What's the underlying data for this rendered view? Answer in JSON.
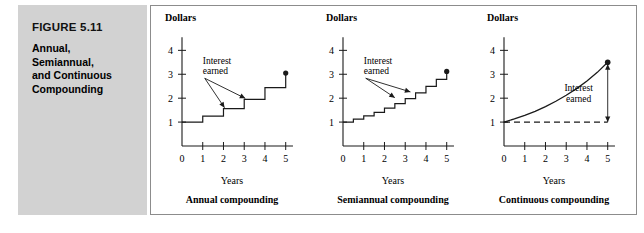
{
  "figure": {
    "number_label": "FIGURE 5.11",
    "title_lines": "Annual,\nSemiannual,\nand Continuous\nCompounding",
    "title_line_1": "Annual,",
    "title_line_2": "Semiannual,",
    "title_line_3": "and Continuous",
    "title_line_4": "Compounding",
    "panel_background": "#d2d2d2"
  },
  "common": {
    "y_axis_title": "Dollars",
    "x_axis_title": "Years",
    "annotation_interest": "Interest",
    "annotation_earned": "earned",
    "y_ticks": [
      "1",
      "2",
      "3",
      "4"
    ],
    "x_ticks": [
      "0",
      "1",
      "2",
      "3",
      "4",
      "5"
    ],
    "line_color": "#1a1a1a"
  },
  "chart_data": [
    {
      "type": "line",
      "title": "Annual compounding",
      "subtitle": "",
      "xlabel": "Years",
      "ylabel": "Dollars",
      "xlim": [
        0,
        5.4
      ],
      "ylim": [
        0,
        4.6
      ],
      "xticks": [
        0,
        1,
        2,
        3,
        4,
        5
      ],
      "xticklabels": [
        "0",
        "1",
        "2",
        "3",
        "4",
        "5"
      ],
      "yticks": [
        1,
        2,
        3,
        4
      ],
      "yticklabels": [
        "1",
        "2",
        "3",
        "4"
      ],
      "grid": false,
      "legend": "none",
      "step_style": "post",
      "x": [
        0,
        1,
        2,
        3,
        4,
        5
      ],
      "values": [
        1.0,
        1.25,
        1.56,
        1.95,
        2.44,
        3.05
      ],
      "endpoint_marker": {
        "x": 5,
        "y": 3.05,
        "shape": "filled-circle"
      },
      "annotations": [
        {
          "text": "Interest",
          "x": 1.0,
          "y": 3.45
        },
        {
          "text": "earned",
          "x": 1.0,
          "y": 3.0
        },
        {
          "arrow_to": [
            2.05,
            1.56
          ]
        },
        {
          "arrow_to": [
            3.05,
            1.95
          ]
        }
      ]
    },
    {
      "type": "line",
      "title": "Semiannual compounding",
      "subtitle": "",
      "xlabel": "Years",
      "ylabel": "Dollars",
      "xlim": [
        0,
        5.4
      ],
      "ylim": [
        0,
        4.6
      ],
      "xticks": [
        0,
        1,
        2,
        3,
        4,
        5
      ],
      "xticklabels": [
        "0",
        "1",
        "2",
        "3",
        "4",
        "5"
      ],
      "yticks": [
        1,
        2,
        3,
        4
      ],
      "yticklabels": [
        "1",
        "2",
        "3",
        "4"
      ],
      "grid": false,
      "legend": "none",
      "step_style": "post",
      "x": [
        0,
        0.5,
        1,
        1.5,
        2,
        2.5,
        3,
        3.5,
        4,
        4.5,
        5
      ],
      "values": [
        1.0,
        1.12,
        1.26,
        1.41,
        1.58,
        1.77,
        1.98,
        2.22,
        2.49,
        2.79,
        3.12
      ],
      "endpoint_marker": {
        "x": 5,
        "y": 3.12,
        "shape": "filled-circle"
      },
      "annotations": [
        {
          "text": "Interest",
          "x": 1.0,
          "y": 3.45
        },
        {
          "text": "earned",
          "x": 1.0,
          "y": 3.0
        },
        {
          "arrow_to": [
            2.5,
            1.98
          ]
        },
        {
          "arrow_to": [
            3.25,
            2.22
          ]
        }
      ]
    },
    {
      "type": "line",
      "title": "Continuous compounding",
      "subtitle": "",
      "xlabel": "Years",
      "ylabel": "Dollars",
      "xlim": [
        0,
        5.4
      ],
      "ylim": [
        0,
        4.6
      ],
      "xticks": [
        0,
        1,
        2,
        3,
        4,
        5
      ],
      "xticklabels": [
        "0",
        "1",
        "2",
        "3",
        "4",
        "5"
      ],
      "yticks": [
        1,
        2,
        3,
        4
      ],
      "yticklabels": [
        "1",
        "2",
        "3",
        "4"
      ],
      "grid": false,
      "legend": "none",
      "curve": "exponential",
      "x": [
        0,
        0.5,
        1,
        1.5,
        2,
        2.5,
        3,
        3.5,
        4,
        4.5,
        5
      ],
      "values": [
        1.0,
        1.13,
        1.28,
        1.45,
        1.65,
        1.87,
        2.12,
        2.4,
        2.72,
        3.08,
        3.5
      ],
      "baseline": {
        "y": 1.0,
        "style": "dashed",
        "label": "principal"
      },
      "endpoint_marker": {
        "x": 5,
        "y": 3.5,
        "shape": "filled-circle"
      },
      "interest_bracket": {
        "x": 5,
        "y_top": 3.42,
        "y_bottom": 1.0,
        "arrows": "both"
      },
      "annotations": [
        {
          "text": "Interest",
          "x": 3.6,
          "y": 2.3
        },
        {
          "text": "earned",
          "x": 3.6,
          "y": 1.85
        }
      ]
    }
  ]
}
